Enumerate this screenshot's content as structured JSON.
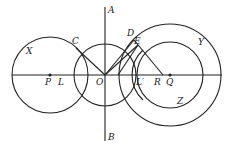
{
  "diagram": {
    "stroke_color": "#222222",
    "labels": {
      "A": "A",
      "B": "B",
      "C": "C",
      "D": "D",
      "E": "E",
      "X": "X",
      "Y": "Y",
      "Z": "Z",
      "P": "P",
      "L": "L",
      "O": "O",
      "L_prime": "L′",
      "R": "R",
      "Q": "Q"
    },
    "circles": [
      {
        "name": "X",
        "cx": 50,
        "cy": 75,
        "r": 38
      },
      {
        "name": "O-circle",
        "cx": 105,
        "cy": 75,
        "r": 31
      },
      {
        "name": "Y",
        "cx": 170,
        "cy": 75,
        "r": 51
      },
      {
        "name": "Z",
        "cx": 170,
        "cy": 75,
        "r": 33
      },
      {
        "name": "L-prime-circle",
        "cx": 168,
        "cy": 75,
        "r": 36
      }
    ]
  }
}
